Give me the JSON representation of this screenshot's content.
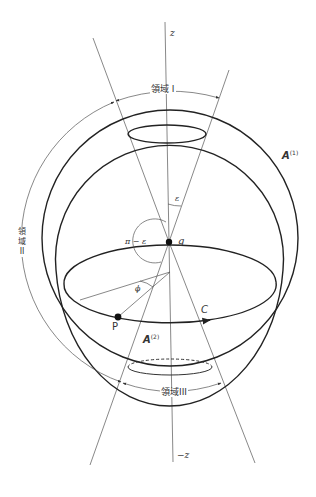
{
  "diagram": {
    "axis_labels": {
      "z_pos": "z",
      "z_neg": "−z"
    },
    "region_labels": {
      "region_1": "領域 I",
      "region_2_chars": [
        "領",
        "域",
        "II"
      ],
      "region_3": "領域III"
    },
    "shell_labels": {
      "outer": {
        "name": "A",
        "sup": "(1)"
      },
      "inner": {
        "name": "A",
        "sup": "(2)"
      }
    },
    "angle_labels": {
      "epsilon": "ε",
      "pi_minus_epsilon": "π − ε",
      "phi": "ϕ"
    },
    "point_labels": {
      "center": "g",
      "point_p": "P",
      "curve_c": "C"
    },
    "colors": {
      "line": "#222222",
      "thin_line": "#555555",
      "background": "#ffffff"
    }
  }
}
